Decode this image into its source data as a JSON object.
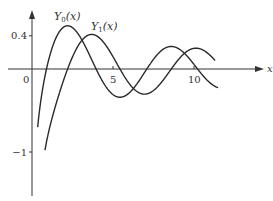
{
  "chart_data": {
    "type": "line",
    "title": "",
    "xlabel": "x",
    "ylabel": "",
    "xlim": [
      0,
      12
    ],
    "ylim": [
      -1.6,
      0.55
    ],
    "x_ticks": [
      {
        "value": 0,
        "label": "0"
      },
      {
        "value": 5,
        "label": "5"
      },
      {
        "value": 10,
        "label": "10"
      }
    ],
    "y_ticks": [
      {
        "value": 0.4,
        "label": "0.4"
      },
      {
        "value": -1,
        "label": "-1"
      }
    ],
    "grid": false,
    "legend": "inline labels",
    "series": [
      {
        "name": "Y0(x)",
        "label_main": "Y",
        "label_sub": "0",
        "label_arg": "(x)",
        "x_range": [
          0.35,
          11.5
        ],
        "key_points": [
          [
            0.89,
            0
          ],
          [
            2.2,
            0.52
          ],
          [
            3.96,
            0
          ],
          [
            5.43,
            -0.34
          ],
          [
            7.09,
            0
          ],
          [
            8.6,
            0.27
          ],
          [
            10.22,
            0
          ],
          [
            11.5,
            -0.11
          ]
        ]
      },
      {
        "name": "Y1(x)",
        "label_main": "Y",
        "label_sub": "1",
        "label_arg": "(x)",
        "x_range": [
          0.8,
          11.3
        ],
        "key_points": [
          [
            2.2,
            0
          ],
          [
            3.68,
            0.42
          ],
          [
            5.43,
            0
          ],
          [
            6.94,
            -0.3
          ],
          [
            8.6,
            0
          ],
          [
            10.0,
            0.25
          ],
          [
            11.3,
            0.12
          ]
        ]
      }
    ]
  },
  "axes": {
    "x_axis_label": "x",
    "origin_label": "0"
  }
}
